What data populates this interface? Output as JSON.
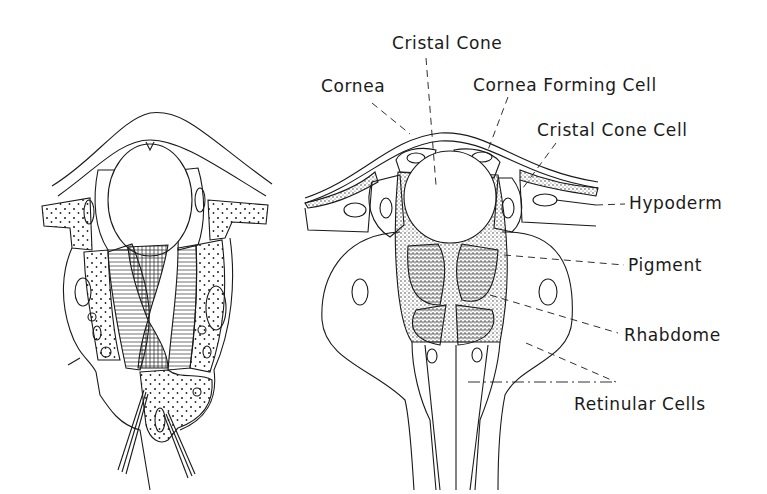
{
  "figure": {
    "left_panel": {
      "description": "Cross-section of ommatidium (left drawing, unlabeled)"
    },
    "right_panel": {
      "labels": [
        {
          "id": "cristal_cone",
          "text": "Cristal Cone"
        },
        {
          "id": "cornea",
          "text": "Cornea"
        },
        {
          "id": "cornea_forming_cell",
          "text": "Cornea Forming Cell"
        },
        {
          "id": "cristal_cone_cell",
          "text": "Cristal Cone Cell"
        },
        {
          "id": "hypoderm",
          "text": "Hypoderm"
        },
        {
          "id": "pigment",
          "text": "Pigment"
        },
        {
          "id": "rhabdome",
          "text": "Rhabdome"
        },
        {
          "id": "retinular_cells",
          "text": "Retinular Cells"
        }
      ]
    },
    "colors": {
      "line": "#1a1a1a",
      "background": "#ffffff"
    }
  }
}
